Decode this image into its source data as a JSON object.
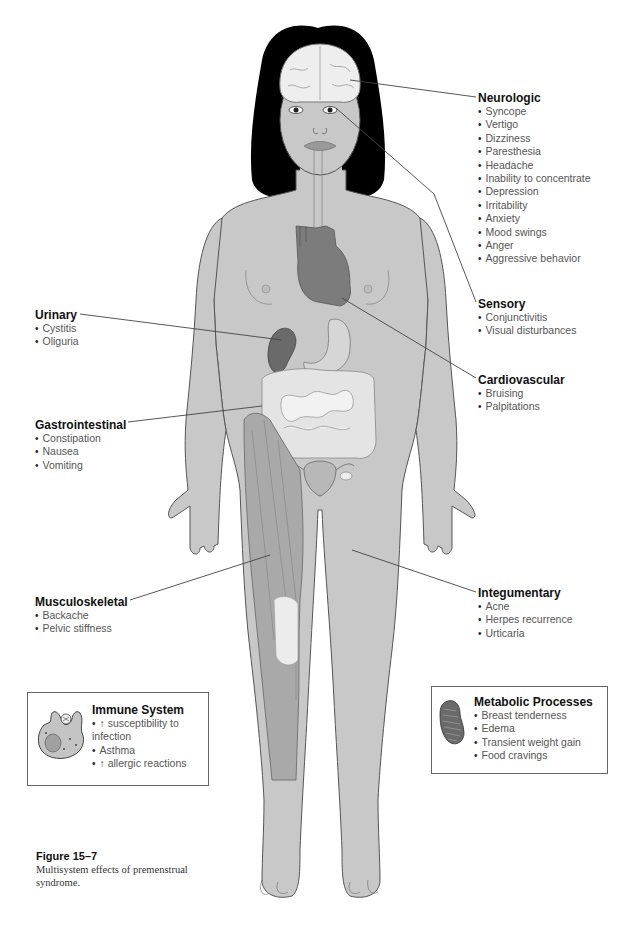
{
  "groups": {
    "neurologic": {
      "title": "Neurologic",
      "items": [
        "Syncope",
        "Vertigo",
        "Dizziness",
        "Paresthesia",
        "Headache",
        "Inability to concentrate",
        "Depression",
        "Irritability",
        "Anxiety",
        "Mood swings",
        "Anger",
        "Aggressive behavior"
      ]
    },
    "sensory": {
      "title": "Sensory",
      "items": [
        "Conjunctivitis",
        "Visual disturbances"
      ]
    },
    "cardiovascular": {
      "title": "Cardiovascular",
      "items": [
        "Bruising",
        "Palpitations"
      ]
    },
    "urinary": {
      "title": "Urinary",
      "items": [
        "Cystitis",
        "Oliguria"
      ]
    },
    "gastrointestinal": {
      "title": "Gastrointestinal",
      "items": [
        "Constipation",
        "Nausea",
        "Vomiting"
      ]
    },
    "musculoskeletal": {
      "title": "Musculoskeletal",
      "items": [
        "Backache",
        "Pelvic stiffness"
      ]
    },
    "integumentary": {
      "title": "Integumentary",
      "items": [
        "Acne",
        "Herpes recurrence",
        "Urticaria"
      ]
    }
  },
  "boxes": {
    "immune": {
      "title": "Immune System",
      "icon": "macrophage-cell-icon",
      "items": [
        "↑ susceptibility to infection",
        "Asthma",
        "↑ allergic reactions"
      ]
    },
    "metabolic": {
      "title": "Metabolic Processes",
      "icon": "mitochondrion-icon",
      "items": [
        "Breast tenderness",
        "Edema",
        "Transient weight gain",
        "Food cravings"
      ]
    }
  },
  "caption": {
    "figure_number": "Figure 15–7",
    "text": "Multisystem effects of premenstrual syndrome."
  },
  "colors": {
    "skin": "#c8c8c8",
    "outline": "#555555",
    "hair": "#000000",
    "organ_dark": "#6e6e6e",
    "organ_mid": "#8c8c8c",
    "intestine": "#e6e6e6",
    "muscle": "#a8a8a8",
    "leader_line": "#444444"
  }
}
